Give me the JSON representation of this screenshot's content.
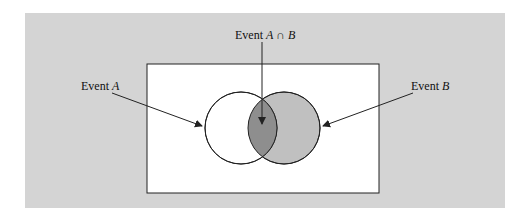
{
  "figure": {
    "labels": {
      "event_a": {
        "prefix": "Event ",
        "var": "A"
      },
      "event_b": {
        "prefix": "Event ",
        "var": "B"
      },
      "intersection": {
        "prefix": "Event ",
        "var1": "A",
        "op": " ∩ ",
        "var2": "B"
      }
    },
    "colors": {
      "panel_bg": "#d4d4d4",
      "sample_space_fill": "#ffffff",
      "circle_a_fill": "#ffffff",
      "circle_b_fill": "#c0c0c0",
      "intersection_fill": "#8e8e8e",
      "stroke": "#222222"
    }
  }
}
